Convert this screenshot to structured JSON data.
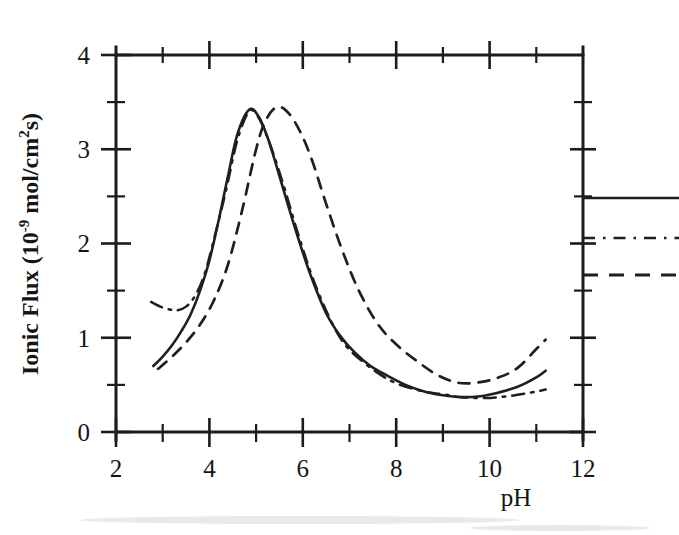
{
  "figure": {
    "background_color": "#ffffff",
    "ink_color": "#1f1f1f"
  },
  "axes": {
    "x": {
      "label": "pH",
      "min": 2,
      "max": 12,
      "major_ticks": [
        2,
        4,
        6,
        8,
        10,
        12
      ],
      "tick_labels": [
        "2",
        "4",
        "6",
        "8",
        "10",
        "12"
      ],
      "minor_ticks": [
        3,
        5,
        7,
        9,
        11
      ]
    },
    "y": {
      "label_prefix": "Ionic Flux (10",
      "label_exponent": "-9",
      "label_mid": " mol/cm",
      "label_sup2": "2",
      "label_suffix": "s)",
      "min": 0,
      "max": 4,
      "major_ticks": [
        0,
        1,
        2,
        3,
        4
      ],
      "tick_labels": [
        "0",
        "1",
        "2",
        "3",
        "4"
      ],
      "minor_ticks": [
        0.5,
        1.5,
        2.5,
        3.5
      ]
    }
  },
  "legend": {
    "position": "right-outside",
    "entries": [
      {
        "name": "series-1",
        "style": "solid",
        "label": ""
      },
      {
        "name": "series-2",
        "style": "dash-dot",
        "label": ""
      },
      {
        "name": "series-3",
        "style": "dashed",
        "label": ""
      }
    ]
  },
  "chart_data": {
    "type": "line",
    "title": "",
    "subtitle": "",
    "xlabel": "pH",
    "ylabel": "Ionic Flux (10-9 mol/cm2s)",
    "xlim": [
      2,
      12
    ],
    "ylim": [
      0,
      4
    ],
    "grid": false,
    "legend_position": "right-outside",
    "annotations": [],
    "series": [
      {
        "name": "solid-curve",
        "style": "solid",
        "peak_x": 4.85,
        "peak_y": 3.42,
        "min_x": 9.4,
        "min_y": 0.37,
        "x": [
          2.8,
          3.0,
          3.2,
          3.4,
          3.6,
          3.8,
          4.0,
          4.2,
          4.4,
          4.6,
          4.85,
          5.05,
          5.25,
          5.45,
          5.7,
          5.95,
          6.2,
          6.5,
          6.8,
          7.1,
          7.45,
          7.8,
          8.2,
          8.6,
          9.0,
          9.4,
          9.8,
          10.2,
          10.6,
          11.0,
          11.2
        ],
        "y": [
          0.7,
          0.8,
          0.92,
          1.07,
          1.25,
          1.5,
          1.82,
          2.25,
          2.72,
          3.16,
          3.42,
          3.35,
          3.12,
          2.8,
          2.38,
          1.98,
          1.62,
          1.26,
          1.02,
          0.85,
          0.7,
          0.6,
          0.5,
          0.43,
          0.39,
          0.37,
          0.38,
          0.42,
          0.48,
          0.58,
          0.65
        ]
      },
      {
        "name": "dash-dot-curve",
        "style": "dash-dot",
        "start_x": 2.75,
        "start_y": 1.38,
        "local_min_x": 3.3,
        "local_min_y": 1.29,
        "x": [
          2.75,
          2.95,
          3.15,
          3.3,
          3.5,
          3.7,
          3.9,
          4.1,
          4.35,
          4.6,
          4.85,
          5.05,
          5.3,
          5.6,
          5.9,
          6.3,
          6.8,
          7.3,
          7.9,
          8.5,
          9.0,
          9.4,
          9.9,
          10.4,
          10.9,
          11.2
        ],
        "y": [
          1.38,
          1.33,
          1.3,
          1.29,
          1.33,
          1.45,
          1.68,
          2.05,
          2.55,
          3.1,
          3.4,
          3.34,
          3.05,
          2.6,
          2.1,
          1.52,
          1.0,
          0.74,
          0.54,
          0.44,
          0.4,
          0.37,
          0.36,
          0.38,
          0.42,
          0.45
        ]
      },
      {
        "name": "dashed-curve",
        "style": "dashed",
        "peak_x": 5.45,
        "peak_y": 3.45,
        "min_x": 9.35,
        "min_y": 0.52,
        "x": [
          2.9,
          3.2,
          3.5,
          3.8,
          4.1,
          4.4,
          4.7,
          5.0,
          5.2,
          5.45,
          5.7,
          5.95,
          6.2,
          6.5,
          6.85,
          7.2,
          7.6,
          8.0,
          8.45,
          8.9,
          9.35,
          9.8,
          10.2,
          10.6,
          11.0,
          11.2
        ],
        "y": [
          0.67,
          0.8,
          0.95,
          1.14,
          1.4,
          1.78,
          2.35,
          3.0,
          3.3,
          3.45,
          3.38,
          3.18,
          2.88,
          2.42,
          1.92,
          1.5,
          1.15,
          0.93,
          0.75,
          0.6,
          0.52,
          0.53,
          0.58,
          0.68,
          0.88,
          0.98
        ]
      }
    ]
  }
}
